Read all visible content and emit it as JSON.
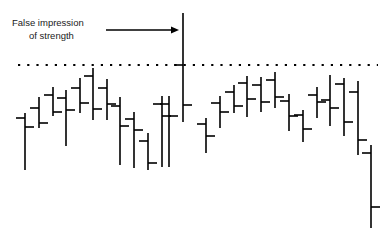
{
  "chart_data": {
    "type": "ohlc",
    "title": "",
    "subtitle": "",
    "xlabel": "",
    "ylabel": "",
    "grid": false,
    "legend": null,
    "axes_visible": false,
    "tick_labels_x": [],
    "tick_labels_y": [],
    "colors": {
      "bar": "#000000",
      "reference_line": "#000000",
      "annotation_text": "#1a1a1a",
      "arrow": "#000000",
      "background": "#ffffff"
    },
    "reference_line": {
      "label": "resistance level",
      "style": "dotted",
      "y_pixel": 65,
      "x_start": 18,
      "x_end": 378
    },
    "annotations": [
      {
        "name": "false-impression-callout",
        "lines": [
          "False impression",
          "of strength"
        ],
        "text_x": 12,
        "line1_y": 26,
        "line2_y": 39,
        "arrow": {
          "x_start": 106,
          "x_end": 179,
          "y": 30
        },
        "points_to_bar_index": 12
      }
    ],
    "bar_width": 9,
    "bars": [
      {
        "i": 0,
        "x": 25,
        "high": 113,
        "low": 170,
        "open": 118,
        "close": 127
      },
      {
        "i": 1,
        "x": 39,
        "high": 97,
        "low": 128,
        "open": 108,
        "close": 123
      },
      {
        "i": 2,
        "x": 53,
        "high": 87,
        "low": 116,
        "open": 95,
        "close": 112
      },
      {
        "i": 3,
        "x": 66,
        "high": 90,
        "low": 146,
        "open": 98,
        "close": 110
      },
      {
        "i": 4,
        "x": 80,
        "high": 78,
        "low": 113,
        "open": 88,
        "close": 103
      },
      {
        "i": 5,
        "x": 93,
        "high": 68,
        "low": 120,
        "open": 76,
        "close": 109
      },
      {
        "i": 6,
        "x": 107,
        "high": 79,
        "low": 120,
        "open": 88,
        "close": 104
      },
      {
        "i": 7,
        "x": 120,
        "high": 97,
        "low": 165,
        "open": 106,
        "close": 126
      },
      {
        "i": 8,
        "x": 134,
        "high": 112,
        "low": 168,
        "open": 119,
        "close": 130
      },
      {
        "i": 9,
        "x": 148,
        "high": 133,
        "low": 170,
        "open": 141,
        "close": 163
      },
      {
        "i": 10,
        "x": 162,
        "high": 96,
        "low": 167,
        "open": 104,
        "close": 116
      },
      {
        "i": 11,
        "x": 169,
        "high": 96,
        "low": 167,
        "open": 104,
        "close": 116
      },
      {
        "i": 12,
        "x": 183,
        "high": 13,
        "low": 122,
        "open": 65,
        "close": 105
      },
      {
        "i": 13,
        "x": 206,
        "high": 118,
        "low": 153,
        "open": 124,
        "close": 136
      },
      {
        "i": 14,
        "x": 220,
        "high": 96,
        "low": 128,
        "open": 103,
        "close": 112
      },
      {
        "i": 15,
        "x": 234,
        "high": 85,
        "low": 113,
        "open": 92,
        "close": 106
      },
      {
        "i": 16,
        "x": 247,
        "high": 76,
        "low": 117,
        "open": 83,
        "close": 99
      },
      {
        "i": 17,
        "x": 261,
        "high": 77,
        "low": 112,
        "open": 85,
        "close": 102
      },
      {
        "i": 18,
        "x": 275,
        "high": 72,
        "low": 108,
        "open": 80,
        "close": 97
      },
      {
        "i": 19,
        "x": 289,
        "high": 94,
        "low": 131,
        "open": 101,
        "close": 116
      },
      {
        "i": 20,
        "x": 303,
        "high": 110,
        "low": 142,
        "open": 115,
        "close": 129
      },
      {
        "i": 21,
        "x": 317,
        "high": 87,
        "low": 118,
        "open": 95,
        "close": 102
      },
      {
        "i": 22,
        "x": 330,
        "high": 75,
        "low": 126,
        "open": 100,
        "close": 108
      },
      {
        "i": 23,
        "x": 344,
        "high": 78,
        "low": 136,
        "open": 84,
        "close": 122
      },
      {
        "i": 24,
        "x": 358,
        "high": 81,
        "low": 155,
        "open": 92,
        "close": 140
      },
      {
        "i": 25,
        "x": 371,
        "high": 145,
        "low": 228,
        "open": 153,
        "close": 207
      }
    ]
  }
}
